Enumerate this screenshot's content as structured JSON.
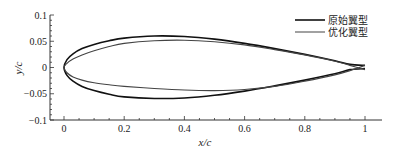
{
  "chart_data": {
    "type": "line",
    "title": "",
    "xlabel": "x/c",
    "ylabel": "y/c",
    "xlim": [
      0,
      1
    ],
    "ylim": [
      -0.1,
      0.1
    ],
    "xticks": [
      "0",
      "0.2",
      "0.4",
      "0.6",
      "0.8",
      "1"
    ],
    "yticks": [
      "0.1",
      "0.05",
      "0",
      "−0.05",
      "−0.1"
    ],
    "grid": false,
    "legend_position": "top-right",
    "series": [
      {
        "name": "原始翼型",
        "color": "#111111",
        "upper": {
          "x": [
            0,
            0.01,
            0.03,
            0.06,
            0.1,
            0.15,
            0.2,
            0.3,
            0.4,
            0.5,
            0.6,
            0.7,
            0.8,
            0.9,
            0.95,
            1.0
          ],
          "y": [
            0,
            0.015,
            0.026,
            0.036,
            0.044,
            0.051,
            0.056,
            0.06,
            0.059,
            0.054,
            0.046,
            0.036,
            0.025,
            0.013,
            0.006,
            0.004
          ]
        },
        "lower": {
          "x": [
            0,
            0.01,
            0.03,
            0.06,
            0.1,
            0.15,
            0.2,
            0.3,
            0.4,
            0.5,
            0.6,
            0.7,
            0.8,
            0.9,
            0.95,
            1.0
          ],
          "y": [
            0,
            -0.015,
            -0.026,
            -0.036,
            -0.044,
            -0.051,
            -0.056,
            -0.059,
            -0.058,
            -0.053,
            -0.045,
            -0.035,
            -0.024,
            -0.012,
            -0.004,
            -0.002
          ]
        }
      },
      {
        "name": "优化翼型",
        "color": "#444444",
        "upper": {
          "x": [
            0,
            0.01,
            0.03,
            0.06,
            0.1,
            0.15,
            0.2,
            0.3,
            0.4,
            0.5,
            0.6,
            0.7,
            0.8,
            0.9,
            0.95,
            1.0
          ],
          "y": [
            0,
            0.008,
            0.016,
            0.024,
            0.032,
            0.04,
            0.046,
            0.051,
            0.052,
            0.049,
            0.043,
            0.034,
            0.024,
            0.012,
            0.004,
            -0.004
          ]
        },
        "lower": {
          "x": [
            0,
            0.01,
            0.03,
            0.06,
            0.1,
            0.15,
            0.2,
            0.3,
            0.4,
            0.5,
            0.6,
            0.7,
            0.8,
            0.9,
            0.95,
            1.0
          ],
          "y": [
            0,
            -0.01,
            -0.018,
            -0.024,
            -0.029,
            -0.033,
            -0.036,
            -0.04,
            -0.043,
            -0.044,
            -0.042,
            -0.036,
            -0.026,
            -0.014,
            -0.006,
            0.004
          ]
        }
      }
    ]
  },
  "legend": {
    "items": [
      {
        "label": "原始翼型",
        "color": "#111111"
      },
      {
        "label": "优化翼型",
        "color": "#555555"
      }
    ]
  },
  "axes": {
    "xlabel": "x/c",
    "ylabel": "y/c"
  }
}
